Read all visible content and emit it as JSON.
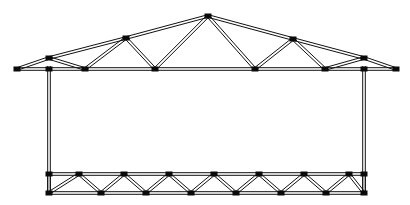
{
  "diagram": {
    "background_color": "#ffffff",
    "member_color": "#111111",
    "joint_color": "#0a0a0a",
    "canvas": {
      "width": 410,
      "height": 205
    },
    "member_offset": 2.6,
    "joint_size": {
      "width": 7,
      "height": 5
    },
    "roof_truss": {
      "name": "roof-truss",
      "apex": {
        "x": 208,
        "y": 16
      },
      "left_overhang_tip": {
        "x": 17,
        "y": 69
      },
      "right_overhang_tip": {
        "x": 396,
        "y": 69
      },
      "left_eave": {
        "x": 49,
        "y": 58
      },
      "right_eave": {
        "x": 364,
        "y": 58
      },
      "top_chord_nodes": [
        {
          "x": 17,
          "y": 69
        },
        {
          "x": 49,
          "y": 58
        },
        {
          "x": 126,
          "y": 38
        },
        {
          "x": 208,
          "y": 16
        },
        {
          "x": 293,
          "y": 39
        },
        {
          "x": 364,
          "y": 58
        },
        {
          "x": 396,
          "y": 69
        }
      ],
      "bottom_chord_nodes": [
        {
          "x": 17,
          "y": 69
        },
        {
          "x": 49,
          "y": 69
        },
        {
          "x": 85,
          "y": 69
        },
        {
          "x": 155,
          "y": 69
        },
        {
          "x": 255,
          "y": 69
        },
        {
          "x": 325,
          "y": 69
        },
        {
          "x": 364,
          "y": 69
        },
        {
          "x": 396,
          "y": 69
        }
      ],
      "web_members": [
        {
          "from": {
            "x": 49,
            "y": 58
          },
          "to": {
            "x": 85,
            "y": 69
          }
        },
        {
          "from": {
            "x": 126,
            "y": 38
          },
          "to": {
            "x": 85,
            "y": 69
          }
        },
        {
          "from": {
            "x": 126,
            "y": 38
          },
          "to": {
            "x": 155,
            "y": 69
          }
        },
        {
          "from": {
            "x": 208,
            "y": 16
          },
          "to": {
            "x": 155,
            "y": 69
          }
        },
        {
          "from": {
            "x": 208,
            "y": 16
          },
          "to": {
            "x": 255,
            "y": 69
          }
        },
        {
          "from": {
            "x": 293,
            "y": 39
          },
          "to": {
            "x": 255,
            "y": 69
          }
        },
        {
          "from": {
            "x": 293,
            "y": 39
          },
          "to": {
            "x": 325,
            "y": 69
          }
        },
        {
          "from": {
            "x": 364,
            "y": 58
          },
          "to": {
            "x": 325,
            "y": 69
          }
        }
      ]
    },
    "columns": [
      {
        "name": "left-column",
        "x": 49,
        "top_y": 66,
        "bottom_y": 194
      },
      {
        "name": "right-column",
        "x": 364,
        "top_y": 66,
        "bottom_y": 194
      }
    ],
    "floor_truss": {
      "name": "floor-warren-truss",
      "top_chord_y": 174,
      "bottom_chord_y": 193,
      "left_x": 49,
      "right_x": 364,
      "top_chord_nodes": [
        {
          "x": 49,
          "y": 174
        },
        {
          "x": 79,
          "y": 174
        },
        {
          "x": 124,
          "y": 174
        },
        {
          "x": 169,
          "y": 174
        },
        {
          "x": 214,
          "y": 174
        },
        {
          "x": 259,
          "y": 174
        },
        {
          "x": 304,
          "y": 174
        },
        {
          "x": 349,
          "y": 174
        },
        {
          "x": 364,
          "y": 174
        }
      ],
      "bottom_chord_nodes": [
        {
          "x": 49,
          "y": 193
        },
        {
          "x": 101,
          "y": 193
        },
        {
          "x": 146,
          "y": 193
        },
        {
          "x": 191,
          "y": 193
        },
        {
          "x": 236,
          "y": 193
        },
        {
          "x": 281,
          "y": 193
        },
        {
          "x": 326,
          "y": 193
        },
        {
          "x": 364,
          "y": 193
        }
      ],
      "diagonals": [
        {
          "from": {
            "x": 49,
            "y": 193
          },
          "to": {
            "x": 79,
            "y": 174
          }
        },
        {
          "from": {
            "x": 79,
            "y": 174
          },
          "to": {
            "x": 101,
            "y": 193
          }
        },
        {
          "from": {
            "x": 101,
            "y": 193
          },
          "to": {
            "x": 124,
            "y": 174
          }
        },
        {
          "from": {
            "x": 124,
            "y": 174
          },
          "to": {
            "x": 146,
            "y": 193
          }
        },
        {
          "from": {
            "x": 146,
            "y": 193
          },
          "to": {
            "x": 169,
            "y": 174
          }
        },
        {
          "from": {
            "x": 169,
            "y": 174
          },
          "to": {
            "x": 191,
            "y": 193
          }
        },
        {
          "from": {
            "x": 191,
            "y": 193
          },
          "to": {
            "x": 214,
            "y": 174
          }
        },
        {
          "from": {
            "x": 214,
            "y": 174
          },
          "to": {
            "x": 236,
            "y": 193
          }
        },
        {
          "from": {
            "x": 236,
            "y": 193
          },
          "to": {
            "x": 259,
            "y": 174
          }
        },
        {
          "from": {
            "x": 259,
            "y": 174
          },
          "to": {
            "x": 281,
            "y": 193
          }
        },
        {
          "from": {
            "x": 281,
            "y": 193
          },
          "to": {
            "x": 304,
            "y": 174
          }
        },
        {
          "from": {
            "x": 304,
            "y": 174
          },
          "to": {
            "x": 326,
            "y": 193
          }
        },
        {
          "from": {
            "x": 326,
            "y": 193
          },
          "to": {
            "x": 349,
            "y": 174
          }
        },
        {
          "from": {
            "x": 349,
            "y": 174
          },
          "to": {
            "x": 364,
            "y": 193
          }
        }
      ]
    },
    "joints": [
      {
        "x": 17,
        "y": 69,
        "name": "joint-left-eave-tip"
      },
      {
        "x": 49,
        "y": 58,
        "name": "joint-left-eave-top"
      },
      {
        "x": 126,
        "y": 38,
        "name": "joint-left-upper-panel"
      },
      {
        "x": 208,
        "y": 16,
        "name": "joint-apex"
      },
      {
        "x": 293,
        "y": 39,
        "name": "joint-right-upper-panel"
      },
      {
        "x": 364,
        "y": 58,
        "name": "joint-right-eave-top"
      },
      {
        "x": 396,
        "y": 69,
        "name": "joint-right-eave-tip"
      },
      {
        "x": 49,
        "y": 69,
        "name": "joint-left-column-top"
      },
      {
        "x": 85,
        "y": 69,
        "name": "joint-bottom-chord-1"
      },
      {
        "x": 155,
        "y": 69,
        "name": "joint-bottom-chord-2"
      },
      {
        "x": 255,
        "y": 69,
        "name": "joint-bottom-chord-3"
      },
      {
        "x": 325,
        "y": 69,
        "name": "joint-bottom-chord-4"
      },
      {
        "x": 364,
        "y": 69,
        "name": "joint-right-column-top"
      },
      {
        "x": 49,
        "y": 174,
        "name": "joint-floor-top-left"
      },
      {
        "x": 79,
        "y": 174,
        "name": "joint-floor-top-1"
      },
      {
        "x": 124,
        "y": 174,
        "name": "joint-floor-top-2"
      },
      {
        "x": 169,
        "y": 174,
        "name": "joint-floor-top-3"
      },
      {
        "x": 214,
        "y": 174,
        "name": "joint-floor-top-4"
      },
      {
        "x": 259,
        "y": 174,
        "name": "joint-floor-top-5"
      },
      {
        "x": 304,
        "y": 174,
        "name": "joint-floor-top-6"
      },
      {
        "x": 349,
        "y": 174,
        "name": "joint-floor-top-7"
      },
      {
        "x": 364,
        "y": 174,
        "name": "joint-floor-top-right"
      },
      {
        "x": 49,
        "y": 193,
        "name": "joint-floor-bottom-left"
      },
      {
        "x": 101,
        "y": 193,
        "name": "joint-floor-bottom-1"
      },
      {
        "x": 146,
        "y": 193,
        "name": "joint-floor-bottom-2"
      },
      {
        "x": 191,
        "y": 193,
        "name": "joint-floor-bottom-3"
      },
      {
        "x": 236,
        "y": 193,
        "name": "joint-floor-bottom-4"
      },
      {
        "x": 281,
        "y": 193,
        "name": "joint-floor-bottom-5"
      },
      {
        "x": 326,
        "y": 193,
        "name": "joint-floor-bottom-6"
      },
      {
        "x": 364,
        "y": 193,
        "name": "joint-floor-bottom-right"
      }
    ]
  }
}
